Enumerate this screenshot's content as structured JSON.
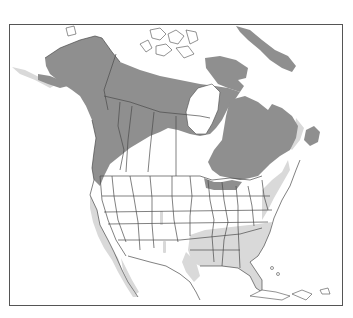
{
  "map": {
    "title": "",
    "region": "North America",
    "legend": [
      {
        "key": "breeding",
        "color": "#8f8f8f"
      },
      {
        "key": "wintering",
        "color": "#d9d9d9"
      }
    ],
    "colors": {
      "background": "#ffffff",
      "frame": "#555555",
      "land": "#ffffff",
      "breeding_range": "#8f8f8f",
      "winter_range": "#d9d9d9",
      "borders": "#4a4a4a"
    }
  }
}
